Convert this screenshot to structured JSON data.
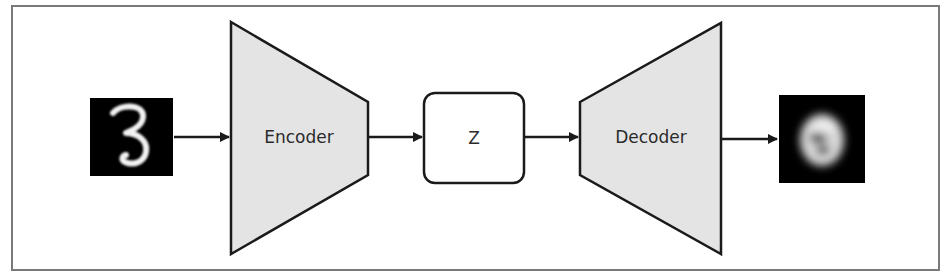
{
  "diagram": {
    "nodes": [
      {
        "id": "input",
        "type": "image",
        "label": "",
        "depicts": "handwritten digit 3 (MNIST, sharp)"
      },
      {
        "id": "encoder",
        "type": "trapezoid-narrowing",
        "label": "Encoder"
      },
      {
        "id": "z",
        "type": "rounded-box",
        "label": "Z"
      },
      {
        "id": "decoder",
        "type": "trapezoid-widening",
        "label": "Decoder"
      },
      {
        "id": "output",
        "type": "image",
        "label": "",
        "depicts": "reconstructed digit 3 (blurry)"
      }
    ],
    "edges": [
      {
        "from": "input",
        "to": "encoder"
      },
      {
        "from": "encoder",
        "to": "z"
      },
      {
        "from": "z",
        "to": "decoder"
      },
      {
        "from": "decoder",
        "to": "output"
      }
    ],
    "labels": {
      "encoder": "Encoder",
      "z": "Z",
      "decoder": "Decoder"
    },
    "colors": {
      "frame_border": "#7a7a7a",
      "shape_fill": "#e4e4e4",
      "stroke": "#1a1a1a",
      "image_bg": "#000000",
      "digit": "#f2f2f2"
    }
  }
}
